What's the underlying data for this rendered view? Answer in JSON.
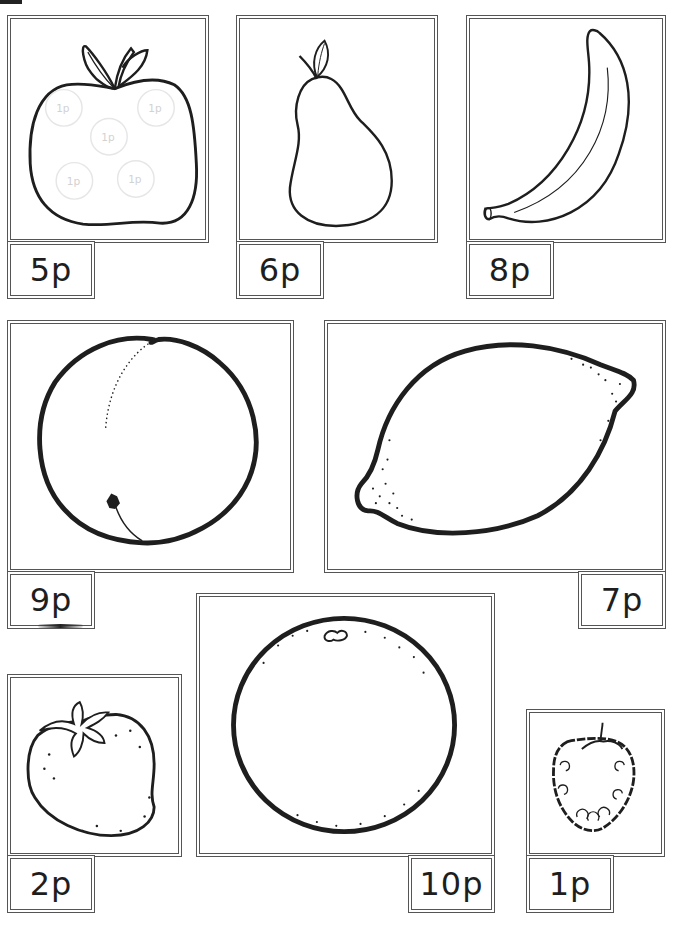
{
  "page": {
    "background": "#ffffff",
    "frame_color": "#555555",
    "ink_color": "#1e1e1e"
  },
  "cards": [
    {
      "fruit": "apple",
      "price": "5p",
      "coins": [
        "1p",
        "1p",
        "1p",
        "1p",
        "1p"
      ]
    },
    {
      "fruit": "pear",
      "price": "6p"
    },
    {
      "fruit": "banana",
      "price": "8p"
    },
    {
      "fruit": "peach",
      "price": "9p"
    },
    {
      "fruit": "lemon",
      "price": "7p"
    },
    {
      "fruit": "orange",
      "price": "10p"
    },
    {
      "fruit": "strawberry",
      "price": "2p"
    },
    {
      "fruit": "raspberry",
      "price": "1p"
    }
  ]
}
